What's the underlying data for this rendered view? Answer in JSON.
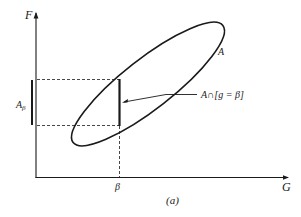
{
  "diagram": {
    "type": "set-projection-diagram",
    "axes": {
      "y_label": "F",
      "x_label": "G"
    },
    "labels": {
      "set_A": "A",
      "projection_main": "A",
      "projection_sub": "β",
      "beta_tick": "β",
      "intersection_label": "A∩[g = β]",
      "caption": "(a)"
    },
    "colors": {
      "stroke": "#1a1a1a",
      "background": "#ffffff"
    },
    "elements": [
      {
        "kind": "axis",
        "name": "F-axis",
        "direction": "vertical"
      },
      {
        "kind": "axis",
        "name": "G-axis",
        "direction": "horizontal"
      },
      {
        "kind": "ellipse",
        "name": "set-A",
        "tilt": "rising diagonal"
      },
      {
        "kind": "segment",
        "name": "intersection-A-g-beta",
        "style": "thick vertical at β"
      },
      {
        "kind": "dashed-lines",
        "name": "projection-guides"
      },
      {
        "kind": "bar",
        "name": "A-beta-projection",
        "position": "left of F-axis"
      },
      {
        "kind": "pointer",
        "name": "intersection-pointer"
      }
    ]
  }
}
